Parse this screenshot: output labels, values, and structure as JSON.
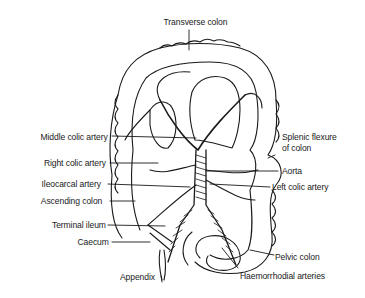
{
  "diagram": {
    "labels": {
      "transverse_colon": "Transverse colon",
      "middle_colic_artery": "Middle colic artery",
      "right_colic_artery": "Right colic artery",
      "ileocarcal_artery": "Ileocarcal artery",
      "ascending_colon": "Ascending colon",
      "terminal_ileum": "Terminal ileum",
      "caecum": "Caecum",
      "appendix": "Appendix",
      "splenic_flexure_line1": "Splenic flexure",
      "splenic_flexure_line2": "of colon",
      "aorta": "Aorta",
      "left_colic_artery": "Left colic artery",
      "pelvic_colon": "Pelvic colon",
      "haemorrhodial_arteries": "Haemorrhodial arteries"
    },
    "colors": {
      "ink": "#1a1a1a",
      "background": "#ffffff"
    }
  }
}
